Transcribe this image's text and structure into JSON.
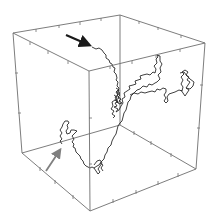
{
  "figure": {
    "type": "3d-random-walk",
    "colors": {
      "background": "#ffffff",
      "cube_edges": "#6e6e6e",
      "walk_path": "#2a2a2a",
      "start_arrow": "#1a1a1a",
      "end_arrow": "#808080"
    },
    "cube": {
      "vertices": {
        "top_left": [
          13,
          33
        ],
        "top_back": [
          120,
          15
        ],
        "top_right": [
          205,
          43
        ],
        "top_front": [
          89,
          71
        ],
        "bottom_left": [
          22,
          153
        ],
        "bottom_back": [
          120,
          125
        ],
        "bottom_right": [
          196,
          169
        ],
        "bottom_front": [
          90,
          211
        ]
      }
    },
    "annotations": {
      "black_arrow": {
        "from": [
          66,
          35
        ],
        "to": [
          91,
          46
        ],
        "label": "start-marker"
      },
      "gray_arrow": {
        "from": [
          46,
          171
        ],
        "to": [
          62,
          147
        ],
        "label": "end-marker"
      }
    }
  }
}
